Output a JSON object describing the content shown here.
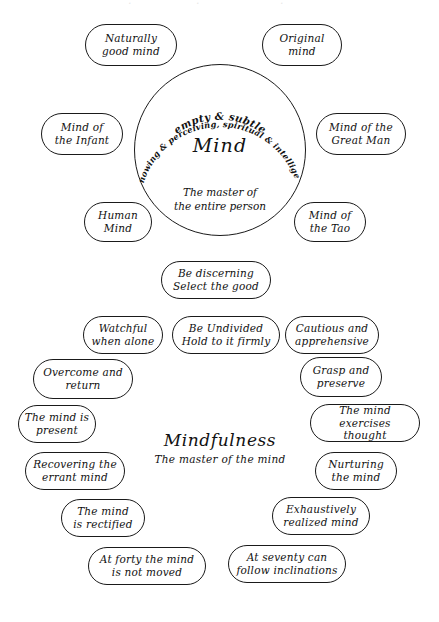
{
  "diagram": {
    "center_circle": {
      "name": "Mind",
      "arc_line_1": "empty & subtle",
      "arc_line_2": "knowing & perceiving, spiritual & intelligent",
      "subtitle": "The master of\nthe entire person"
    },
    "mind_nodes": [
      {
        "id": "naturally-good-mind",
        "label": "Naturally\ngood mind",
        "x": 85,
        "y": 24,
        "w": 92,
        "h": 42
      },
      {
        "id": "original-mind",
        "label": "Original\nmind",
        "x": 262,
        "y": 24,
        "w": 80,
        "h": 42
      },
      {
        "id": "mind-of-the-infant",
        "label": "Mind of\nthe Infant",
        "x": 41,
        "y": 113,
        "w": 82,
        "h": 42
      },
      {
        "id": "mind-of-the-great-man",
        "label": "Mind of the\nGreat Man",
        "x": 316,
        "y": 113,
        "w": 90,
        "h": 42
      },
      {
        "id": "human-mind",
        "label": "Human\nMind",
        "x": 84,
        "y": 202,
        "w": 68,
        "h": 40
      },
      {
        "id": "mind-of-the-tao",
        "label": "Mind of\nthe Tao",
        "x": 294,
        "y": 202,
        "w": 72,
        "h": 40
      }
    ],
    "mindfulness_center": {
      "title": "Mindfulness",
      "subtitle": "The master of the mind"
    },
    "mindfulness_nodes": [
      {
        "id": "be-discerning",
        "label": "Be discerning\nSelect the good",
        "x": 161,
        "y": 261,
        "w": 110,
        "h": 38
      },
      {
        "id": "watchful-when-alone",
        "label": "Watchful\nwhen alone",
        "x": 83,
        "y": 316,
        "w": 80,
        "h": 38
      },
      {
        "id": "be-undivided",
        "label": "Be Undivided\nHold to it firmly",
        "x": 172,
        "y": 316,
        "w": 108,
        "h": 38
      },
      {
        "id": "cautious-and-apprehensive",
        "label": "Cautious and\napprehensive",
        "x": 285,
        "y": 316,
        "w": 94,
        "h": 38
      },
      {
        "id": "overcome-and-return",
        "label": "Overcome and\nreturn",
        "x": 33,
        "y": 359,
        "w": 100,
        "h": 40
      },
      {
        "id": "grasp-and-preserve",
        "label": "Grasp and\npreserve",
        "x": 300,
        "y": 357,
        "w": 82,
        "h": 40
      },
      {
        "id": "the-mind-is-present",
        "label": "The mind is\npresent",
        "x": 18,
        "y": 405,
        "w": 78,
        "h": 38
      },
      {
        "id": "the-mind-exercises-thought",
        "label": "The mind\nexercises thought",
        "x": 310,
        "y": 404,
        "w": 110,
        "h": 38
      },
      {
        "id": "recovering-the-errant-mind",
        "label": "Recovering the\nerrant mind",
        "x": 25,
        "y": 452,
        "w": 100,
        "h": 38
      },
      {
        "id": "nurturing-the-mind",
        "label": "Nurturing\nthe mind",
        "x": 315,
        "y": 452,
        "w": 82,
        "h": 38
      },
      {
        "id": "the-mind-is-rectified",
        "label": "The mind\nis rectified",
        "x": 61,
        "y": 499,
        "w": 84,
        "h": 38
      },
      {
        "id": "exhaustively-realized-mind",
        "label": "Exhaustively\nrealized mind",
        "x": 272,
        "y": 497,
        "w": 98,
        "h": 38
      },
      {
        "id": "at-forty-the-mind",
        "label": "At forty  the mind\nis not moved",
        "x": 88,
        "y": 547,
        "w": 118,
        "h": 38
      },
      {
        "id": "at-seventy-can-follow",
        "label": "At seventy can\nfollow inclinations",
        "x": 228,
        "y": 545,
        "w": 118,
        "h": 38
      }
    ]
  },
  "colors": {
    "ink": "#111111",
    "paper": "#ffffff"
  }
}
